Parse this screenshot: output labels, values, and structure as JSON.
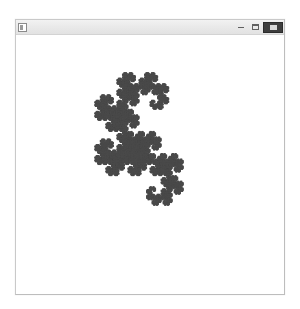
{
  "window": {
    "title": "",
    "icon": "application-icon",
    "controls": {
      "minimize_label": "",
      "maximize_label": "",
      "close_label": ""
    }
  },
  "canvas": {
    "background_color": "#ffffff",
    "dot_color": "#4a4a4a"
  },
  "chart_data": {
    "type": "scatter",
    "title": "",
    "subtitle": "",
    "xlabel": "",
    "ylabel": "",
    "fractal": "heighway-dragon-curve",
    "iterations": 14,
    "point_count": 16384,
    "dot_size_px": 1.6,
    "dot_color": "#4a4a4a",
    "background": "#ffffff",
    "grid": false,
    "legend": null,
    "axes_visible": false,
    "bounding_box_px": {
      "x": 38,
      "y": 73,
      "width": 202,
      "height": 132
    },
    "turn_rule": "L-system: X -> X+YF+, Y -> -FX-Y, axiom FX, angle 90",
    "start_point": [
      0,
      0
    ],
    "start_heading_deg": 0,
    "xlim": [
      -0.35,
      1.05
    ],
    "ylim": [
      -0.55,
      0.45
    ]
  }
}
